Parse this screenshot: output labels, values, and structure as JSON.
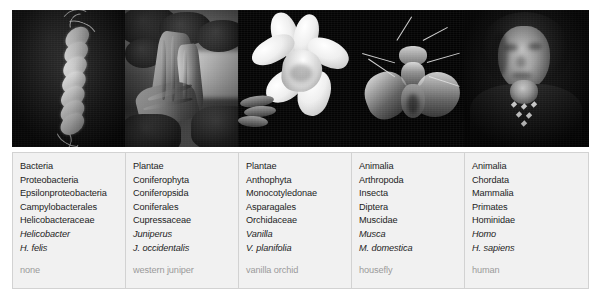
{
  "figure": {
    "columns": [
      {
        "photo_alt": "helicobacter-micrograph",
        "ranks": [
          "Bacteria",
          "Proteobacteria",
          "Epsilonproteobacteria",
          "Campylobacterales",
          "Helicobacteraceae",
          "Helicobacter",
          "H. felis"
        ],
        "common_name": "none"
      },
      {
        "photo_alt": "western-juniper-tree",
        "ranks": [
          "Plantae",
          "Coniferophyta",
          "Coniferopsida",
          "Coniferales",
          "Cupressaceae",
          "Juniperus",
          "J. occidentalis"
        ],
        "common_name": "western juniper"
      },
      {
        "photo_alt": "vanilla-orchid-flower",
        "ranks": [
          "Plantae",
          "Anthophyta",
          "Monocotyledonae",
          "Asparagales",
          "Orchidaceae",
          "Vanilla",
          "V. planifolia"
        ],
        "common_name": "vanilla orchid"
      },
      {
        "photo_alt": "housefly-dorsal-view",
        "ranks": [
          "Animalia",
          "Arthropoda",
          "Insecta",
          "Diptera",
          "Muscidae",
          "Musca",
          "M. domestica"
        ],
        "common_name": "housefly"
      },
      {
        "photo_alt": "human-portrait",
        "ranks": [
          "Animalia",
          "Chordata",
          "Mammalia",
          "Primates",
          "Hominidae",
          "Homo",
          "H. sapiens"
        ],
        "common_name": "human"
      }
    ],
    "style": {
      "italic_rank_indices": [
        5,
        6
      ],
      "box_background": "#f1f1f1",
      "box_border": "#d2d2d2",
      "rank_text_color": "#1d1d1d",
      "common_name_color": "#9a9a9a",
      "page_background": "#ffffff"
    }
  }
}
